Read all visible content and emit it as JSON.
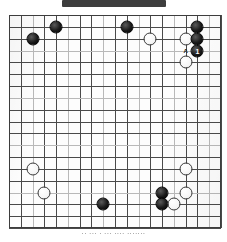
{
  "header": {
    "band_text": "",
    "band_color": "#343434"
  },
  "board": {
    "type": "go-board",
    "size": 19,
    "visible_columns": 18,
    "visible_rows": 18,
    "grid_color": "#4a4a4a",
    "background_color": "#fdfdfd",
    "note": "scanned go problem diagram, board cropped at edges"
  },
  "stones": [
    {
      "color": "black",
      "col": 2,
      "row": 2,
      "label": ""
    },
    {
      "color": "black",
      "col": 4,
      "row": 1,
      "label": ""
    },
    {
      "color": "black",
      "col": 10,
      "row": 1,
      "label": ""
    },
    {
      "color": "black",
      "col": 16,
      "row": 1,
      "label": ""
    },
    {
      "color": "white",
      "col": 12,
      "row": 2,
      "label": ""
    },
    {
      "color": "white",
      "col": 15,
      "row": 2,
      "label": ""
    },
    {
      "color": "black",
      "col": 16,
      "row": 2,
      "label": ""
    },
    {
      "color": "black",
      "col": 16,
      "row": 3,
      "label": "1"
    },
    {
      "color": "white",
      "col": 15,
      "row": 4,
      "label": ""
    },
    {
      "color": "white",
      "col": 2,
      "row": 13,
      "label": ""
    },
    {
      "color": "white",
      "col": 3,
      "row": 15,
      "label": ""
    },
    {
      "color": "white",
      "col": 15,
      "row": 13,
      "label": ""
    },
    {
      "color": "black",
      "col": 13,
      "row": 15,
      "label": ""
    },
    {
      "color": "white",
      "col": 15,
      "row": 15,
      "label": ""
    },
    {
      "color": "black",
      "col": 13,
      "row": 16,
      "label": ""
    },
    {
      "color": "white",
      "col": 14,
      "row": 16,
      "label": ""
    },
    {
      "color": "black",
      "col": 8,
      "row": 16,
      "label": ""
    }
  ],
  "point_labels": [
    {
      "text": "A",
      "col": 15,
      "row": 3
    }
  ],
  "caption": {
    "text": "·· ··· · ··· ···· ·······"
  }
}
